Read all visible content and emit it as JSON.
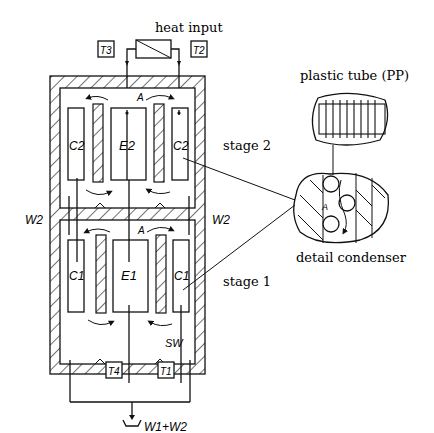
{
  "diagram": {
    "title_heat": "heat input",
    "labels": {
      "T3": "T3",
      "T2": "T2",
      "T4": "T4",
      "T1": "T1",
      "A_top": "A",
      "A_mid": "A",
      "A_detail": "A",
      "W2_left": "W2",
      "W2_right": "W2",
      "SW": "SW",
      "output": "W1+W2",
      "C2_left": "C2",
      "E2": "E2",
      "C2_right": "C2",
      "C1_left": "C1",
      "E1": "E1",
      "C1_right": "C1"
    },
    "stage2": "stage 2",
    "stage1": "stage 1",
    "plastic_tube": "plastic tube (PP)",
    "detail_condenser": "detail condenser",
    "colors": {
      "ink": "#111111",
      "background": "#ffffff"
    }
  }
}
